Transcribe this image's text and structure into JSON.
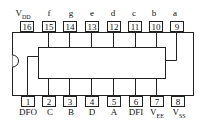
{
  "chip": {
    "top_pins": [
      {
        "num": "16",
        "label": "V",
        "sub": "DD"
      },
      {
        "num": "15",
        "label": "f",
        "sub": ""
      },
      {
        "num": "14",
        "label": "g",
        "sub": ""
      },
      {
        "num": "13",
        "label": "e",
        "sub": ""
      },
      {
        "num": "12",
        "label": "d",
        "sub": ""
      },
      {
        "num": "11",
        "label": "c",
        "sub": ""
      },
      {
        "num": "10",
        "label": "b",
        "sub": ""
      },
      {
        "num": "9",
        "label": "a",
        "sub": ""
      }
    ],
    "bottom_pins": [
      {
        "num": "1",
        "label": "DFO",
        "sub": ""
      },
      {
        "num": "2",
        "label": "C",
        "sub": ""
      },
      {
        "num": "3",
        "label": "B",
        "sub": ""
      },
      {
        "num": "4",
        "label": "D",
        "sub": ""
      },
      {
        "num": "5",
        "label": "A",
        "sub": ""
      },
      {
        "num": "6",
        "label": "DFI",
        "sub": ""
      },
      {
        "num": "7",
        "label": "V",
        "sub": "EE"
      },
      {
        "num": "8",
        "label": "V",
        "sub": "SS"
      }
    ]
  }
}
